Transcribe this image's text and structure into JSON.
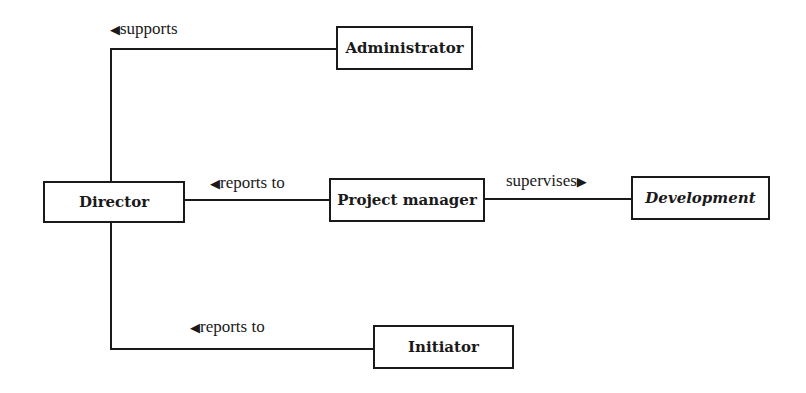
{
  "diagram": {
    "type": "organizational-relationship",
    "nodes": [
      {
        "id": "director",
        "label": "Director",
        "italic": false
      },
      {
        "id": "administrator",
        "label": "Administrator",
        "italic": false
      },
      {
        "id": "project_manager",
        "label": "Project manager",
        "italic": false
      },
      {
        "id": "development",
        "label": "Development",
        "italic": true
      },
      {
        "id": "initiator",
        "label": "Initiator",
        "italic": false
      }
    ],
    "edges": [
      {
        "from": "administrator",
        "to": "director",
        "label": "supports",
        "arrow": "left-triangle-icon",
        "arrow_glyph": "◀"
      },
      {
        "from": "project_manager",
        "to": "director",
        "label": "reports to",
        "arrow": "left-triangle-icon",
        "arrow_glyph": "◀"
      },
      {
        "from": "project_manager",
        "to": "development",
        "label": "supervises",
        "arrow": "right-triangle-icon",
        "arrow_glyph": "▶"
      },
      {
        "from": "initiator",
        "to": "director",
        "label": "reports to",
        "arrow": "left-triangle-icon",
        "arrow_glyph": "◀"
      }
    ]
  },
  "colors": {
    "line": "#1a1a1a",
    "background": "#ffffff"
  }
}
